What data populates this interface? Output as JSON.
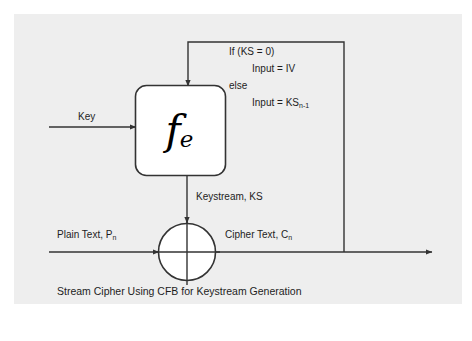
{
  "figure": {
    "background_color": "#eeeeee",
    "line_color": "#333333",
    "text_color": "#1d1d1d"
  },
  "block": {
    "function_symbol": "f",
    "function_subscript": "e",
    "name": "encryption-function-block"
  },
  "labels": {
    "key": "Key",
    "keystream": "Keystream, KS",
    "plain_text": "Plain Text, P",
    "plain_text_sub": "n",
    "cipher_text": "Cipher Text, C",
    "cipher_text_sub": "n"
  },
  "condition": {
    "line1": "If (KS = 0)",
    "line2": "Input = IV",
    "line3": "else",
    "line4_prefix": "Input = KS",
    "line4_sub": "n-1"
  },
  "caption": "Stream Cipher Using CFB for Keystream Generation",
  "subcaption": ""
}
